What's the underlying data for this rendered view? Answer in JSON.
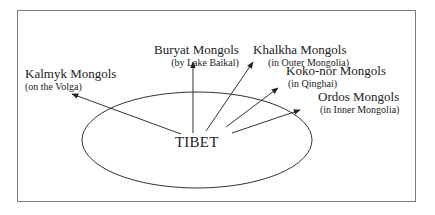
{
  "diagram": {
    "center": {
      "label": "TIBET"
    },
    "destinations": [
      {
        "name": "Kalmyk Mongols",
        "location": "(on the Volga)"
      },
      {
        "name": "Buryat Mongols",
        "location": "(by Lake Baikal)"
      },
      {
        "name": "Khalkha Mongols",
        "location": "(in Outer Mongolia)"
      },
      {
        "name": "Koko-nor Mongols",
        "location": "(in Qinghai)"
      },
      {
        "name": "Ordos Mongols",
        "location": "(in Inner Mongolia)"
      }
    ]
  }
}
